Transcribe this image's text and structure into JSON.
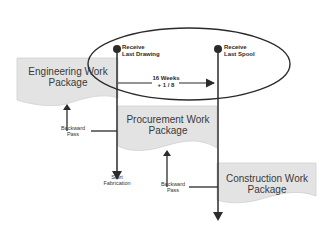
{
  "diagram": {
    "type": "schedule-flow",
    "colors": {
      "package_fill": "#e3e3e3",
      "package_stroke": "#cfcfcf",
      "line": "#2b2b2b",
      "text": "#333333"
    },
    "packages": [
      {
        "id": "engineering",
        "label_line1": "Engineering Work",
        "label_line2": "Package"
      },
      {
        "id": "procurement",
        "label_line1": "Procurement Work",
        "label_line2": "Package"
      },
      {
        "id": "construction",
        "label_line1": "Construction Work",
        "label_line2": "Package"
      }
    ],
    "milestones": [
      {
        "id": "receive-last-drawing",
        "line1": "Receive",
        "line2": "Last Drawing"
      },
      {
        "id": "receive-last-spool",
        "line1": "Receive",
        "line2": "Last Spool"
      }
    ],
    "duration": {
      "line1": "16 Weeks",
      "line2": "+ 1 / 8"
    },
    "arrows": [
      {
        "id": "backward-pass-1",
        "line1": "Backward",
        "line2": "Pass"
      },
      {
        "id": "backward-pass-2",
        "line1": "Backward",
        "line2": "Pass"
      }
    ],
    "endpoints": [
      {
        "id": "start-fabrication",
        "line1": "Start",
        "line2": "Fabrication"
      }
    ]
  }
}
